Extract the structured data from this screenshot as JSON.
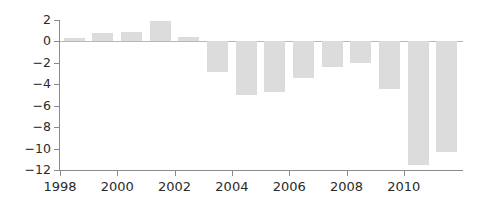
{
  "chart_data": {
    "type": "bar",
    "title": "",
    "subtitle": "",
    "xlabel": "",
    "ylabel": "",
    "categories": [
      1998,
      1999,
      2000,
      2001,
      2002,
      2003,
      2004,
      2005,
      2006,
      2007,
      2008,
      2009,
      2010,
      2011
    ],
    "values": [
      0.3,
      0.8,
      0.9,
      1.9,
      0.4,
      -2.9,
      -5.0,
      -4.7,
      -3.4,
      -2.4,
      -2.0,
      -4.4,
      -11.5,
      -10.3
    ],
    "series": [
      {
        "name": "",
        "values": [
          0.3,
          0.8,
          0.9,
          1.9,
          0.4,
          -2.9,
          -5.0,
          -4.7,
          -3.4,
          -2.4,
          -2.0,
          -4.4,
          -11.5,
          -10.3
        ]
      }
    ],
    "ylim": [
      -12,
      2
    ],
    "xlim": [
      1997.5,
      2011.5
    ],
    "y_ticks": [
      2,
      0,
      -2,
      -4,
      -6,
      -8,
      -10,
      -12
    ],
    "y_tick_labels": [
      "2",
      "0",
      "−2",
      "−4",
      "−6",
      "−8",
      "−10",
      "−12"
    ],
    "x_ticks": [
      1998,
      2000,
      2002,
      2004,
      2006,
      2008,
      2010
    ],
    "x_tick_labels": [
      "1998",
      "2000",
      "2002",
      "2004",
      "2006",
      "2008",
      "2010"
    ],
    "grid": false,
    "legend": false,
    "legend_position": "none",
    "bar_color": "#dcdcdc",
    "axis_color": "#8a8a8a",
    "zero_line_color": "#b8b8b8",
    "text_color": "#2a2a2a",
    "background_color": "#ffffff"
  }
}
